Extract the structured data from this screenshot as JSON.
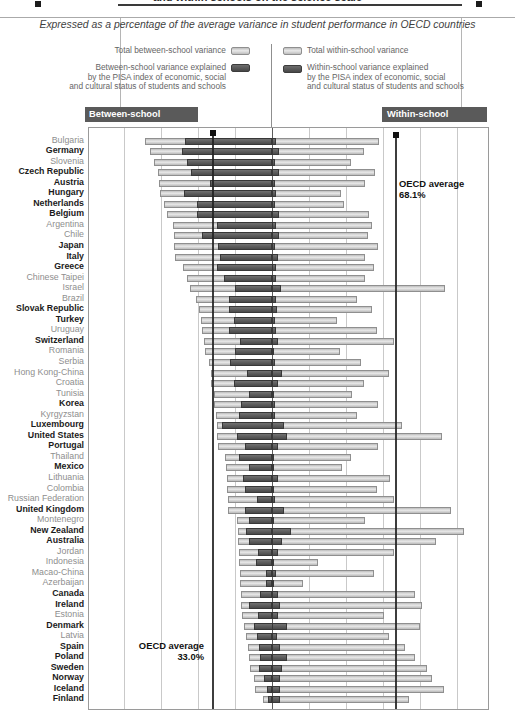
{
  "title": "and within schools on the science scale",
  "subtitle": "Expressed as a percentage of the average variance in student performance in OECD countries",
  "legend": {
    "total_between": "Total between-school variance",
    "between_explained_l1": "Between-school variance explained",
    "between_explained_l2": "by the PISA index of economic, social",
    "between_explained_l3": "and cultural status of students and schools",
    "total_within": "Total within-school variance",
    "within_explained_l1": "Within-school variance explained",
    "within_explained_l2": "by the PISA index of economic, social",
    "within_explained_l3": "and cultural status of students and schools"
  },
  "panel_headers": {
    "between": "Between-school variance",
    "within": "Within-school variance"
  },
  "annotations": {
    "oecd_within_label": "OECD average",
    "oecd_within_value": "68.1%",
    "oecd_between_label": "OECD average",
    "oecd_between_value": "33.0%"
  },
  "colors": {
    "bar_light": "#cfcfcf",
    "bar_dark": "#555555",
    "header_bg": "#5a5a5a",
    "oecd_line": "#1c1c1c",
    "gridline": "#c9c9c9"
  },
  "chart_data": {
    "type": "bar",
    "orientation": "horizontal-diverging",
    "unit": "percent of average variance in student performance in OECD countries",
    "axis": {
      "zero_center": true,
      "gridline_step_pct": 20,
      "left_max_pct": 100,
      "right_max_pct": 117,
      "tick_labels_shown": false
    },
    "legend_position": "top",
    "oecd_average": {
      "between_pct": 33.0,
      "within_pct": 68.1
    },
    "series_names": [
      "between_total",
      "between_explained",
      "within_total",
      "within_explained"
    ],
    "countries": [
      {
        "name": "Bulgaria",
        "oecd": false,
        "between_total": 68.5,
        "between_explained": 47.0,
        "within_total": 58.0,
        "within_explained": 2.0
      },
      {
        "name": "Germany",
        "oecd": true,
        "between_total": 66.0,
        "between_explained": 48.5,
        "within_total": 49.5,
        "within_explained": 4.0
      },
      {
        "name": "Slovenia",
        "oecd": false,
        "between_total": 64.0,
        "between_explained": 46.0,
        "within_total": 42.5,
        "within_explained": 1.5
      },
      {
        "name": "Czech Republic",
        "oecd": true,
        "between_total": 61.5,
        "between_explained": 44.0,
        "within_total": 55.5,
        "within_explained": 4.0
      },
      {
        "name": "Austria",
        "oecd": true,
        "between_total": 61.0,
        "between_explained": 33.5,
        "within_total": 50.0,
        "within_explained": 1.5
      },
      {
        "name": "Hungary",
        "oecd": true,
        "between_total": 60.5,
        "between_explained": 47.5,
        "within_total": 37.5,
        "within_explained": 2.0
      },
      {
        "name": "Netherlands",
        "oecd": true,
        "between_total": 58.5,
        "between_explained": 40.5,
        "within_total": 39.0,
        "within_explained": 1.5
      },
      {
        "name": "Belgium",
        "oecd": true,
        "between_total": 57.0,
        "between_explained": 40.5,
        "within_total": 52.5,
        "within_explained": 4.0
      },
      {
        "name": "Argentina",
        "oecd": false,
        "between_total": 53.5,
        "between_explained": 30.0,
        "within_total": 54.0,
        "within_explained": 2.0
      },
      {
        "name": "Chile",
        "oecd": false,
        "between_total": 53.0,
        "between_explained": 38.0,
        "within_total": 52.0,
        "within_explained": 4.0
      },
      {
        "name": "Japan",
        "oecd": true,
        "between_total": 53.0,
        "between_explained": 29.0,
        "within_total": 57.5,
        "within_explained": 1.5
      },
      {
        "name": "Italy",
        "oecd": true,
        "between_total": 52.5,
        "between_explained": 28.0,
        "within_total": 50.5,
        "within_explained": 3.0
      },
      {
        "name": "Greece",
        "oecd": true,
        "between_total": 48.0,
        "between_explained": 30.0,
        "within_total": 55.0,
        "within_explained": 2.0
      },
      {
        "name": "Chinese Taipei",
        "oecd": false,
        "between_total": 46.0,
        "between_explained": 26.0,
        "within_total": 50.5,
        "within_explained": 2.0
      },
      {
        "name": "Israel",
        "oecd": false,
        "between_total": 44.5,
        "between_explained": 20.0,
        "within_total": 93.5,
        "within_explained": 5.0
      },
      {
        "name": "Brazil",
        "oecd": false,
        "between_total": 41.0,
        "between_explained": 23.5,
        "within_total": 46.0,
        "within_explained": 2.0
      },
      {
        "name": "Slovak Republic",
        "oecd": true,
        "between_total": 39.5,
        "between_explained": 23.0,
        "within_total": 54.0,
        "within_explained": 2.5
      },
      {
        "name": "Turkey",
        "oecd": true,
        "between_total": 38.5,
        "between_explained": 20.5,
        "within_total": 35.0,
        "within_explained": 1.5
      },
      {
        "name": "Uruguay",
        "oecd": false,
        "between_total": 38.0,
        "between_explained": 23.0,
        "within_total": 57.0,
        "within_explained": 2.0
      },
      {
        "name": "Switzerland",
        "oecd": true,
        "between_total": 37.0,
        "between_explained": 17.5,
        "within_total": 66.0,
        "within_explained": 3.0
      },
      {
        "name": "Romania",
        "oecd": false,
        "between_total": 36.0,
        "between_explained": 20.0,
        "within_total": 37.0,
        "within_explained": 1.0
      },
      {
        "name": "Serbia",
        "oecd": false,
        "between_total": 34.0,
        "between_explained": 22.5,
        "within_total": 48.0,
        "within_explained": 1.5
      },
      {
        "name": "Hong Kong-China",
        "oecd": false,
        "between_total": 33.0,
        "between_explained": 13.5,
        "within_total": 63.0,
        "within_explained": 5.5
      },
      {
        "name": "Croatia",
        "oecd": false,
        "between_total": 33.0,
        "between_explained": 20.5,
        "within_total": 49.5,
        "within_explained": 3.0
      },
      {
        "name": "Tunisia",
        "oecd": false,
        "between_total": 31.5,
        "between_explained": 12.5,
        "within_total": 43.0,
        "within_explained": 1.0
      },
      {
        "name": "Korea",
        "oecd": true,
        "between_total": 31.5,
        "between_explained": 17.0,
        "within_total": 57.5,
        "within_explained": 1.5
      },
      {
        "name": "Kyrgyzstan",
        "oecd": false,
        "between_total": 30.5,
        "between_explained": 18.0,
        "within_total": 46.0,
        "within_explained": 1.5
      },
      {
        "name": "Luxembourg",
        "oecd": true,
        "between_total": 30.0,
        "between_explained": 27.0,
        "within_total": 70.5,
        "within_explained": 6.5
      },
      {
        "name": "United States",
        "oecd": true,
        "between_total": 29.5,
        "between_explained": 19.0,
        "within_total": 92.0,
        "within_explained": 8.0
      },
      {
        "name": "Portugal",
        "oecd": true,
        "between_total": 29.0,
        "between_explained": 14.5,
        "within_total": 57.5,
        "within_explained": 3.5
      },
      {
        "name": "Thailand",
        "oecd": false,
        "between_total": 25.5,
        "between_explained": 18.0,
        "within_total": 42.5,
        "within_explained": 1.0
      },
      {
        "name": "Mexico",
        "oecd": true,
        "between_total": 25.0,
        "between_explained": 12.5,
        "within_total": 38.0,
        "within_explained": 1.0
      },
      {
        "name": "Lithuania",
        "oecd": false,
        "between_total": 24.5,
        "between_explained": 15.5,
        "within_total": 64.0,
        "within_explained": 3.5
      },
      {
        "name": "Colombia",
        "oecd": false,
        "between_total": 24.5,
        "between_explained": 14.5,
        "within_total": 57.0,
        "within_explained": 1.0
      },
      {
        "name": "Russian Federation",
        "oecd": false,
        "between_total": 24.0,
        "between_explained": 8.0,
        "within_total": 66.0,
        "within_explained": 1.5
      },
      {
        "name": "United Kingdom",
        "oecd": true,
        "between_total": 24.0,
        "between_explained": 14.5,
        "within_total": 96.5,
        "within_explained": 6.5
      },
      {
        "name": "Montenegro",
        "oecd": false,
        "between_total": 19.0,
        "between_explained": 12.5,
        "within_total": 50.5,
        "within_explained": 1.0
      },
      {
        "name": "New Zealand",
        "oecd": true,
        "between_total": 18.5,
        "between_explained": 14.0,
        "within_total": 104.0,
        "within_explained": 10.0
      },
      {
        "name": "Australia",
        "oecd": true,
        "between_total": 18.5,
        "between_explained": 12.5,
        "within_total": 88.5,
        "within_explained": 5.5
      },
      {
        "name": "Jordan",
        "oecd": false,
        "between_total": 18.0,
        "between_explained": 7.5,
        "within_total": 66.0,
        "within_explained": 3.0
      },
      {
        "name": "Indonesia",
        "oecd": false,
        "between_total": 18.0,
        "between_explained": 8.5,
        "within_total": 25.0,
        "within_explained": 1.0
      },
      {
        "name": "Macao-China",
        "oecd": false,
        "between_total": 17.5,
        "between_explained": 3.5,
        "within_total": 55.0,
        "within_explained": 2.0
      },
      {
        "name": "Azerbaijan",
        "oecd": false,
        "between_total": 17.5,
        "between_explained": 3.5,
        "within_total": 17.0,
        "within_explained": 1.0
      },
      {
        "name": "Canada",
        "oecd": true,
        "between_total": 17.0,
        "between_explained": 6.5,
        "within_total": 77.5,
        "within_explained": 3.5
      },
      {
        "name": "Ireland",
        "oecd": true,
        "between_total": 16.5,
        "between_explained": 12.5,
        "within_total": 81.0,
        "within_explained": 4.5
      },
      {
        "name": "Estonia",
        "oecd": false,
        "between_total": 16.0,
        "between_explained": 7.5,
        "within_total": 60.5,
        "within_explained": 3.5
      },
      {
        "name": "Denmark",
        "oecd": true,
        "between_total": 15.0,
        "between_explained": 10.0,
        "within_total": 80.0,
        "within_explained": 8.0
      },
      {
        "name": "Latvia",
        "oecd": false,
        "between_total": 14.0,
        "between_explained": 8.0,
        "within_total": 63.0,
        "within_explained": 2.5
      },
      {
        "name": "Spain",
        "oecd": true,
        "between_total": 13.0,
        "between_explained": 7.0,
        "within_total": 72.0,
        "within_explained": 4.5
      },
      {
        "name": "Poland",
        "oecd": true,
        "between_total": 12.5,
        "between_explained": 6.5,
        "within_total": 77.5,
        "within_explained": 8.0
      },
      {
        "name": "Sweden",
        "oecd": true,
        "between_total": 12.0,
        "between_explained": 7.0,
        "within_total": 84.0,
        "within_explained": 5.5
      },
      {
        "name": "Norway",
        "oecd": true,
        "between_total": 10.0,
        "between_explained": 4.5,
        "within_total": 86.5,
        "within_explained": 4.5
      },
      {
        "name": "Iceland",
        "oecd": true,
        "between_total": 9.0,
        "between_explained": 2.5,
        "within_total": 93.0,
        "within_explained": 4.5
      },
      {
        "name": "Finland",
        "oecd": true,
        "between_total": 5.0,
        "between_explained": 2.0,
        "within_total": 74.0,
        "within_explained": 4.5
      }
    ]
  }
}
